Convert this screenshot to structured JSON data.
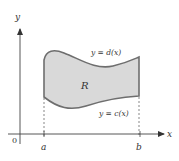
{
  "figure": {
    "axes": {
      "x_label": "x",
      "y_label": "y",
      "origin_label": "0",
      "axis_color": "#444444"
    },
    "bounds": {
      "a_label": "a",
      "b_label": "b"
    },
    "region": {
      "label": "R",
      "fill_color": "#d9d9d9",
      "border_color": "#6e6e6e"
    },
    "curves": {
      "upper": "y = d(x)",
      "lower": "y = c(x)"
    }
  }
}
